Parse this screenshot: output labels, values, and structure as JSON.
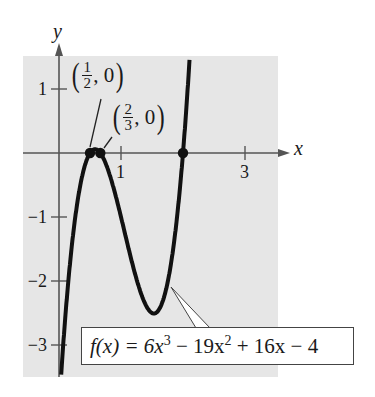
{
  "chart_data": {
    "type": "line",
    "title": "",
    "function": "f(x) = 6x^3 - 19x^2 + 16x - 4",
    "coefficients": [
      6,
      -19,
      16,
      -4
    ],
    "xlabel": "x",
    "ylabel": "y",
    "xlim": [
      -0.6,
      3.5
    ],
    "ylim": [
      -3.5,
      1.5
    ],
    "x_ticks": [
      1,
      3
    ],
    "x_tick_labels": [
      "1",
      "3"
    ],
    "y_ticks": [
      1,
      -1,
      -2,
      -3
    ],
    "y_tick_labels": [
      "1",
      "−1",
      "−2",
      "−3"
    ],
    "grid": false,
    "background": "#e8e8e8",
    "curve_color": "#111111",
    "zeros": [
      {
        "x": 0.5,
        "y": 0,
        "label": "(1/2, 0)"
      },
      {
        "x": 0.6667,
        "y": 0,
        "label": "(2/3, 0)"
      },
      {
        "x": 2,
        "y": 0,
        "label": ""
      }
    ],
    "local_max": {
      "x": 0.57,
      "y": 0.06
    },
    "local_min": {
      "x": 1.55,
      "y": -2.51
    },
    "annotations": [
      "(1/2, 0)",
      "(2/3, 0)",
      "f(x) = 6x^3 - 19x^2 + 16x - 4"
    ]
  },
  "labels": {
    "x_axis": "x",
    "y_axis": "y",
    "point1": {
      "num": "1",
      "den": "2",
      "y": "0"
    },
    "point2": {
      "num": "2",
      "den": "3",
      "y": "0"
    },
    "formula": {
      "lhs": "f(x) = 6x",
      "exp1": "3",
      "mid": " − 19x",
      "exp2": "2",
      "rhs": " + 16x − 4"
    }
  }
}
